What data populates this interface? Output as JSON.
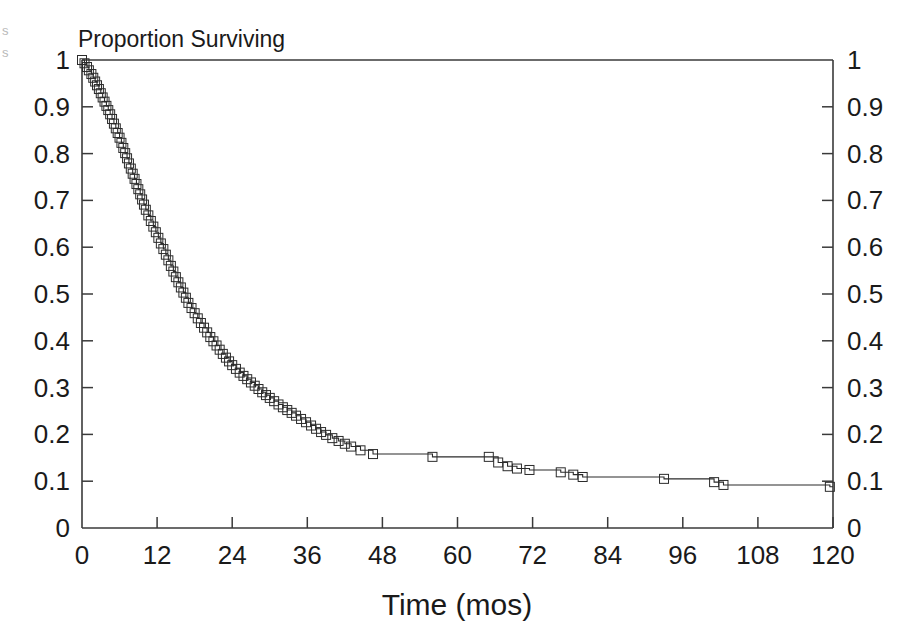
{
  "figure": {
    "title": "Proportion Surviving",
    "edge_artifacts": [
      "s",
      "s"
    ],
    "background_color": "#ffffff",
    "line_color": "#2b2b2b",
    "marker_color": "#2b2b2b",
    "axis_color": "#3a3a3a"
  },
  "chart_data": {
    "type": "line",
    "title": "Proportion Surviving",
    "subtitle": "",
    "xlabel": "Time (mos)",
    "ylabel": "",
    "ylabel_right": "",
    "xlim": [
      0,
      120
    ],
    "ylim": [
      0,
      1
    ],
    "grid": false,
    "legend": null,
    "legend_position": "none",
    "xticks": [
      0,
      12,
      24,
      36,
      48,
      60,
      72,
      84,
      96,
      108,
      120
    ],
    "xtick_labels": [
      "0",
      "12",
      "24",
      "36",
      "48",
      "60",
      "72",
      "84",
      "96",
      "108",
      "120"
    ],
    "yticks": [
      0,
      0.1,
      0.2,
      0.3,
      0.4,
      0.5,
      0.6,
      0.7,
      0.8,
      0.9,
      1
    ],
    "ytick_labels": [
      "0",
      "0.1",
      "0.2",
      "0.3",
      "0.4",
      "0.5",
      "0.6",
      "0.7",
      "0.8",
      "0.9",
      "1"
    ],
    "ytick_labels_right": [
      "0",
      "0.1",
      "0.2",
      "0.3",
      "0.4",
      "0.5",
      "0.6",
      "0.7",
      "0.8",
      "0.9",
      "1"
    ],
    "marker": "square",
    "marker_size": 9,
    "series": [
      {
        "name": "Kaplan-Meier survival",
        "x": [
          0.0,
          0.4,
          0.8,
          1.1,
          1.5,
          1.8,
          2.1,
          2.4,
          2.7,
          3.0,
          3.3,
          3.6,
          3.9,
          4.2,
          4.5,
          4.8,
          5.1,
          5.4,
          5.7,
          6.0,
          6.3,
          6.6,
          6.9,
          7.2,
          7.5,
          7.8,
          8.1,
          8.4,
          8.7,
          9.0,
          9.3,
          9.6,
          9.9,
          10.2,
          10.6,
          11.0,
          11.4,
          11.8,
          12.2,
          12.6,
          13.0,
          13.4,
          13.8,
          14.2,
          14.6,
          15.0,
          15.4,
          15.8,
          16.2,
          16.6,
          17.0,
          17.5,
          18.0,
          18.5,
          19.0,
          19.5,
          20.0,
          20.5,
          21.0,
          21.5,
          22.0,
          22.5,
          23.0,
          23.5,
          24.0,
          24.6,
          25.2,
          25.8,
          26.4,
          27.0,
          27.6,
          28.2,
          28.8,
          29.4,
          30.0,
          30.7,
          31.4,
          32.1,
          32.8,
          33.5,
          34.2,
          35.0,
          35.8,
          36.6,
          37.4,
          38.2,
          39.0,
          40.0,
          41.0,
          42.0,
          43.0,
          44.5,
          46.5,
          56.0,
          65.0,
          66.5,
          68.0,
          69.5,
          71.5,
          76.5,
          78.5,
          80.0,
          93.0,
          101.0,
          102.5,
          119.5
        ],
        "values": [
          1.0,
          0.993,
          0.985,
          0.978,
          0.97,
          0.962,
          0.954,
          0.946,
          0.938,
          0.929,
          0.92,
          0.911,
          0.902,
          0.893,
          0.884,
          0.874,
          0.864,
          0.854,
          0.844,
          0.834,
          0.823,
          0.812,
          0.801,
          0.79,
          0.779,
          0.768,
          0.757,
          0.746,
          0.735,
          0.724,
          0.713,
          0.702,
          0.691,
          0.68,
          0.668,
          0.656,
          0.644,
          0.632,
          0.62,
          0.608,
          0.596,
          0.584,
          0.572,
          0.56,
          0.548,
          0.536,
          0.525,
          0.514,
          0.503,
          0.492,
          0.481,
          0.47,
          0.459,
          0.448,
          0.438,
          0.428,
          0.418,
          0.408,
          0.399,
          0.39,
          0.381,
          0.372,
          0.364,
          0.356,
          0.348,
          0.34,
          0.332,
          0.325,
          0.318,
          0.311,
          0.304,
          0.297,
          0.29,
          0.284,
          0.278,
          0.271,
          0.264,
          0.258,
          0.252,
          0.246,
          0.24,
          0.233,
          0.226,
          0.219,
          0.212,
          0.205,
          0.199,
          0.192,
          0.186,
          0.18,
          0.174,
          0.166,
          0.158,
          0.152,
          0.152,
          0.14,
          0.132,
          0.127,
          0.124,
          0.119,
          0.114,
          0.109,
          0.105,
          0.098,
          0.092,
          0.088
        ]
      }
    ]
  }
}
